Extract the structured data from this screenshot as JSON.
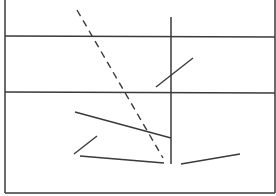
{
  "diagram": {
    "width": 276,
    "height": 196,
    "background": "#ffffff",
    "stroke_color": "#3a3a3a",
    "frame": {
      "left": 5,
      "right": 275,
      "bottom": 193,
      "top_open": true,
      "stroke_width": 1.5
    },
    "horizontal_rules": [
      {
        "name": "upper-horizontal-line",
        "x1": 5,
        "y1": 36,
        "x2": 275,
        "y2": 37,
        "width": 1.5
      },
      {
        "name": "lower-horizontal-line",
        "x1": 5,
        "y1": 92,
        "x2": 275,
        "y2": 93,
        "width": 1.5
      }
    ],
    "segments": [
      {
        "name": "vertical-line",
        "x1": 171,
        "y1": 17,
        "x2": 171,
        "y2": 164,
        "width": 1.5,
        "dashed": false
      },
      {
        "name": "dashed-diagonal-line",
        "x1": 77,
        "y1": 10,
        "x2": 163,
        "y2": 158,
        "width": 1.4,
        "dashed": true
      },
      {
        "name": "short-diagonal-upper-right",
        "x1": 156,
        "y1": 87,
        "x2": 193,
        "y2": 58,
        "width": 1.4,
        "dashed": false
      },
      {
        "name": "sloped-line-middle",
        "x1": 75,
        "y1": 112,
        "x2": 171,
        "y2": 138,
        "width": 1.4,
        "dashed": false
      },
      {
        "name": "short-diagonal-lower-left",
        "x1": 74,
        "y1": 154,
        "x2": 97,
        "y2": 136,
        "width": 1.4,
        "dashed": false
      },
      {
        "name": "bottom-line-left",
        "x1": 80,
        "y1": 156,
        "x2": 164,
        "y2": 163,
        "width": 1.4,
        "dashed": false
      },
      {
        "name": "bottom-line-right",
        "x1": 181,
        "y1": 164,
        "x2": 240,
        "y2": 154,
        "width": 1.4,
        "dashed": false
      }
    ]
  }
}
